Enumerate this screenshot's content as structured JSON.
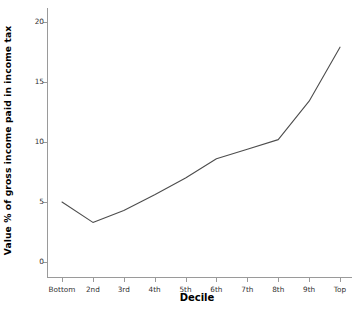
{
  "chart_data": {
    "type": "line",
    "title": "",
    "xlabel": "Decile",
    "ylabel": "Value % of gross income paid in income tax",
    "categories": [
      "Bottom",
      "2nd",
      "3rd",
      "4th",
      "5th",
      "6th",
      "7th",
      "8th",
      "9th",
      "Top"
    ],
    "values": [
      5.0,
      3.3,
      4.3,
      5.6,
      7.0,
      8.6,
      9.4,
      10.2,
      13.4,
      17.9
    ],
    "series": [
      {
        "name": "Value % of gross income paid in income tax",
        "values": [
          5.0,
          3.3,
          4.3,
          5.6,
          7.0,
          8.6,
          9.4,
          10.2,
          13.4,
          17.9
        ]
      }
    ],
    "ylim": [
      0,
      20
    ],
    "yticks": [
      0,
      5,
      10,
      15,
      20
    ],
    "ytick_labels": [
      "0",
      "5",
      "10",
      "15",
      "20"
    ],
    "grid": false,
    "legend": false,
    "line_color": "#4d4d4d",
    "axis_color": "#9a9a9a"
  },
  "axes": {
    "y_title": "Value % of gross income paid in income tax",
    "x_title": "Decile"
  }
}
